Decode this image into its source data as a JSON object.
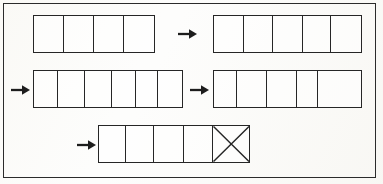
{
  "page": {
    "background_color": "#fbfbf9",
    "frame_color": "#2b2b2b",
    "line_color": "#262626"
  },
  "diagram": {
    "type": "cell-strip-worksheet",
    "arrow_glyph": "→",
    "rows": [
      {
        "row_label": "row-1",
        "items": [
          {
            "kind": "strip",
            "name": "strip-r1-left",
            "cells": 4,
            "crossed_cells": [],
            "cell_widths": [
              30,
              31,
              30,
              31
            ]
          },
          {
            "kind": "arrow",
            "name": "arrow-r1-mid",
            "direction": "right"
          },
          {
            "kind": "strip",
            "name": "strip-r1-right",
            "cells": 5,
            "crossed_cells": [],
            "cell_widths": [
              30,
              30,
              30,
              29,
              30
            ]
          }
        ]
      },
      {
        "row_label": "row-2",
        "items": [
          {
            "kind": "arrow",
            "name": "arrow-r2-left",
            "direction": "right"
          },
          {
            "kind": "strip",
            "name": "strip-r2-left",
            "cells": 6,
            "crossed_cells": [],
            "cell_widths": [
              24,
              28,
              27,
              24,
              23,
              24
            ]
          },
          {
            "kind": "arrow",
            "name": "arrow-r2-mid",
            "direction": "right"
          },
          {
            "kind": "strip",
            "name": "strip-r2-right",
            "cells": 5,
            "crossed_cells": [],
            "cell_widths": [
              23,
              31,
              30,
              21,
              44
            ]
          }
        ]
      },
      {
        "row_label": "row-3",
        "items": [
          {
            "kind": "arrow",
            "name": "arrow-r3-left",
            "direction": "right"
          },
          {
            "kind": "strip",
            "name": "strip-r3",
            "cells": 5,
            "crossed_cells": [
              4
            ],
            "cell_widths": [
              27,
              29,
              30,
              29,
              37
            ]
          }
        ]
      }
    ]
  }
}
